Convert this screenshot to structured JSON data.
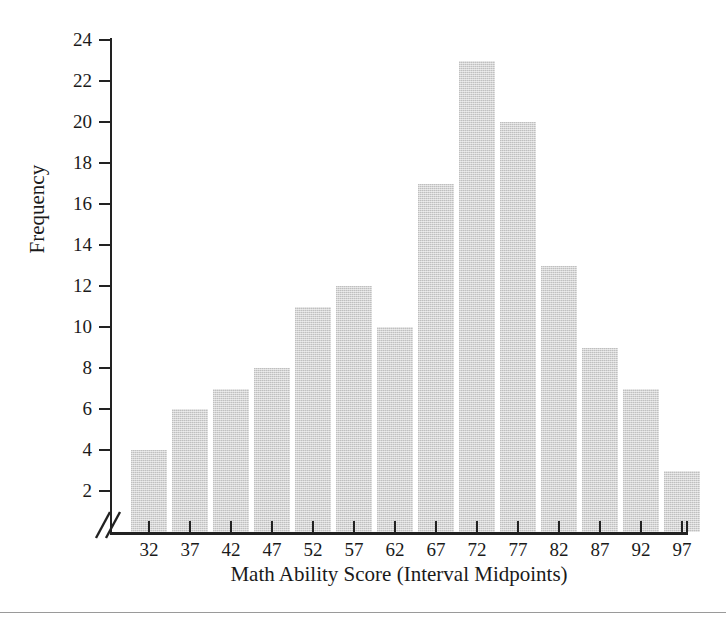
{
  "chart_data": {
    "type": "bar",
    "title": "",
    "subtitle": "",
    "xlabel": "Math Ability Score (Interval Midpoints)",
    "ylabel": "Frequency",
    "categories": [
      "32",
      "37",
      "42",
      "47",
      "52",
      "57",
      "62",
      "67",
      "72",
      "77",
      "82",
      "87",
      "92",
      "97"
    ],
    "values": [
      4,
      6,
      7,
      8,
      11,
      12,
      10,
      17,
      23,
      20,
      13,
      9,
      7,
      3
    ],
    "ylim": [
      0,
      24
    ],
    "ytick_labels": [
      "2",
      "4",
      "6",
      "8",
      "10",
      "12",
      "14",
      "16",
      "18",
      "20",
      "22",
      "24"
    ],
    "ytick_values": [
      2,
      4,
      6,
      8,
      10,
      12,
      14,
      16,
      18,
      20,
      22,
      24
    ],
    "grid": false,
    "legend": null,
    "legend_position": "none",
    "annotations": [
      {
        "name": "axis-break",
        "symbol": "//",
        "description": "double slash axis break at origin of x-axis"
      }
    ],
    "bar_color": "#d4d4d4",
    "axis_color": "#222222",
    "text_color": "#1a1a1a"
  }
}
